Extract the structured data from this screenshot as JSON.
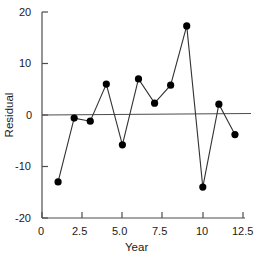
{
  "chart_data": {
    "type": "line",
    "title": "",
    "subtitle": "",
    "xlabel": "Year",
    "ylabel": "Residual",
    "x": [
      1,
      2,
      3,
      4,
      5,
      6,
      7,
      8,
      9,
      10,
      11,
      12
    ],
    "values": [
      -13,
      -0.6,
      -1.2,
      6,
      -5.8,
      7,
      2.3,
      5.8,
      17.3,
      -14,
      2.1,
      -3.8
    ],
    "series": [
      {
        "name": "Residual",
        "x": [
          1,
          2,
          3,
          4,
          5,
          6,
          7,
          8,
          9,
          10,
          11,
          12
        ],
        "values": [
          -13,
          -0.6,
          -1.2,
          6,
          -5.8,
          7,
          2.3,
          5.8,
          17.3,
          -14,
          2.1,
          -3.8
        ]
      }
    ],
    "xlim": [
      0,
      12.5
    ],
    "ylim": [
      -20,
      20
    ],
    "xticks": [
      0,
      2.5,
      5.0,
      7.5,
      10,
      12.5
    ],
    "xtick_labels": [
      "0",
      "2.5",
      "5.0",
      "7.5",
      "10",
      "12.5"
    ],
    "yticks": [
      -20,
      -10,
      0,
      10,
      20
    ],
    "ytick_labels": [
      "-20",
      "-10",
      "0",
      "10",
      "20"
    ],
    "grid": false,
    "legend": null,
    "zero_reference_line": 0,
    "marker": "filled-circle",
    "marker_color": "#000000",
    "line_color": "#333333",
    "axis_color": "#4d4d4d",
    "background_color": "#ffffff"
  },
  "axes": {
    "y_title": "Residual",
    "x_title": "Year"
  }
}
